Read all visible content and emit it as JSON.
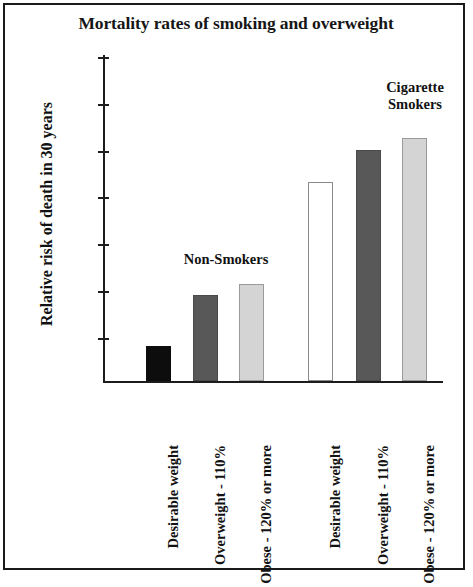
{
  "chart_data": {
    "type": "bar",
    "title": "Mortality rates of smoking and overweight",
    "xlabel": "",
    "ylabel": "Relative risk of death in 30 years",
    "ylim": [
      0,
      14
    ],
    "ytick_step": 2,
    "yticks": [
      "14",
      "12",
      "10",
      "8",
      "6",
      "4",
      "2"
    ],
    "grid": false,
    "legend": "none",
    "categories": [
      "Desirable weight",
      "Overweight - 110%",
      "Obese - 120% or more",
      "Desirable weight",
      "Overweight - 110%",
      "Obese - 120% or more"
    ],
    "values": [
      1.5,
      3.7,
      4.2,
      8.6,
      10.0,
      10.5
    ],
    "bar_fills": [
      "black",
      "dark",
      "light",
      "white",
      "dark",
      "light"
    ],
    "groups": [
      {
        "name": "Non-Smokers",
        "label": "Non-Smokers",
        "members": [
          0,
          1,
          2
        ]
      },
      {
        "name": "Cigarette Smokers",
        "label": "Cigarette\nSmokers",
        "members": [
          3,
          4,
          5
        ]
      }
    ],
    "annotations": [
      {
        "text": "Non-Smokers"
      },
      {
        "text": "Cigarette\nSmokers"
      }
    ]
  },
  "colors": {
    "black_bar": "#0d0d0d",
    "dark_gray_bar": "#585858",
    "light_gray_bar": "#d4d4d4",
    "white_bar": "#ffffff",
    "axis": "#1c1c1c",
    "border": "#1a1a1a",
    "text": "#111111"
  }
}
